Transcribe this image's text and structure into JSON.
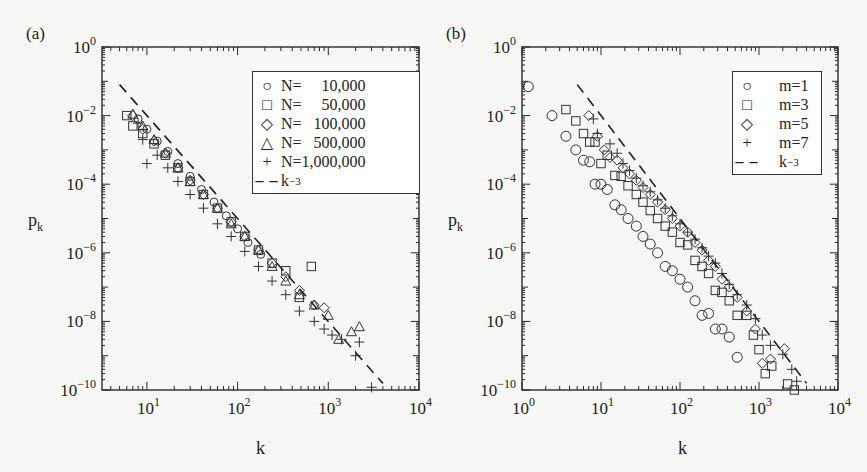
{
  "panels": [
    {
      "id": "a",
      "label": "(a)",
      "xlabel": "k",
      "ylabel": "p",
      "ylabel_sub": "k",
      "x_ticks": [
        {
          "exp": "1",
          "value": 10
        },
        {
          "exp": "2",
          "value": 100
        },
        {
          "exp": "3",
          "value": 1000
        },
        {
          "exp": "4",
          "value": 10000
        }
      ],
      "y_ticks": [
        {
          "exp": "0"
        },
        {
          "exp": "−2"
        },
        {
          "exp": "−4"
        },
        {
          "exp": "−6"
        },
        {
          "exp": "−8"
        },
        {
          "exp": "−10"
        }
      ],
      "legend": [
        {
          "symbol": "○",
          "text": "N=     10,000"
        },
        {
          "symbol": "□",
          "text": "N=     50,000"
        },
        {
          "symbol": "◇",
          "text": "N=   100,000"
        },
        {
          "symbol": "△",
          "text": "N=   500,000"
        },
        {
          "symbol": "+",
          "text": "N=1,000,000"
        },
        {
          "symbol": "– –",
          "text": "k",
          "sup": "−3"
        }
      ]
    },
    {
      "id": "b",
      "label": "(b)",
      "xlabel": "k",
      "ylabel": "p",
      "ylabel_sub": "k",
      "x_ticks": [
        {
          "exp": "0"
        },
        {
          "exp": "1"
        },
        {
          "exp": "2"
        },
        {
          "exp": "3"
        },
        {
          "exp": "4"
        }
      ],
      "y_ticks": [
        {
          "exp": "0"
        },
        {
          "exp": "−2"
        },
        {
          "exp": "−4"
        },
        {
          "exp": "−6"
        },
        {
          "exp": "−8"
        },
        {
          "exp": "−10"
        }
      ],
      "legend": [
        {
          "symbol": "○",
          "text": "m=1"
        },
        {
          "symbol": "□",
          "text": "m=3"
        },
        {
          "symbol": "◇",
          "text": "m=5"
        },
        {
          "symbol": "+",
          "text": "m=7"
        },
        {
          "symbol": "– –",
          "text": "k",
          "sup": "−3"
        }
      ]
    }
  ],
  "chart_data": [
    {
      "type": "scatter",
      "title": "(a)",
      "xlabel": "k",
      "ylabel": "p_k",
      "xscale": "log",
      "yscale": "log",
      "xlim": [
        3,
        10000
      ],
      "ylim": [
        1e-10,
        1
      ],
      "grid": false,
      "legend_position": "upper right",
      "series": [
        {
          "name": "N=10,000",
          "marker": "circle",
          "x": [
            8,
            10,
            13,
            17,
            22,
            30,
            40,
            55,
            75,
            100,
            130,
            180
          ],
          "y": [
            0.008,
            0.004,
            0.0018,
            0.0009,
            0.0004,
            0.00017,
            7e-05,
            3e-05,
            1.2e-05,
            5e-06,
            2e-06,
            9e-07
          ]
        },
        {
          "name": "N=50,000",
          "marker": "square",
          "x": [
            6,
            7,
            9,
            12,
            16,
            22,
            30,
            42,
            60,
            85,
            120,
            170,
            240,
            340,
            480,
            650
          ],
          "y": [
            0.01,
            0.005,
            0.003,
            0.0015,
            0.0007,
            0.0003,
            0.00012,
            5e-05,
            2e-05,
            8e-06,
            3e-06,
            1.2e-06,
            5e-07,
            3e-07,
            5e-08,
            4e-07
          ]
        },
        {
          "name": "N=100,000",
          "marker": "diamond",
          "x": [
            7,
            9,
            12,
            16,
            22,
            30,
            42,
            60,
            85,
            120,
            170,
            240,
            340,
            480,
            700,
            900
          ],
          "y": [
            0.01,
            0.004,
            0.0018,
            0.0008,
            0.0003,
            0.00013,
            5e-05,
            2e-05,
            8e-06,
            3e-06,
            1.2e-06,
            5e-07,
            2e-07,
            8e-08,
            3e-08,
            2.5e-08
          ]
        },
        {
          "name": "N=500,000",
          "marker": "triangle",
          "x": [
            7,
            9,
            12,
            16,
            22,
            30,
            42,
            60,
            85,
            120,
            170,
            240,
            340,
            480,
            700,
            1000,
            1300,
            1800,
            2200
          ],
          "y": [
            0.011,
            0.005,
            0.002,
            0.0008,
            0.0003,
            0.00012,
            5e-05,
            2e-05,
            7e-06,
            3e-06,
            1.2e-06,
            4e-07,
            1.5e-07,
            6e-08,
            3e-08,
            1.5e-08,
            3e-09,
            5e-09,
            7e-09
          ]
        },
        {
          "name": "N=1,000,000",
          "marker": "plus",
          "x": [
            8,
            9,
            10,
            13,
            17,
            22,
            30,
            42,
            60,
            85,
            120,
            170,
            240,
            340,
            480,
            700,
            900,
            1100,
            1400,
            2000,
            2200,
            3000
          ],
          "y": [
            0.006,
            0.002,
            0.0004,
            0.0007,
            0.0003,
            0.00012,
            5e-05,
            2e-05,
            7e-06,
            3e-06,
            1.1e-06,
            4e-07,
            1.5e-07,
            6e-08,
            2e-08,
            1e-08,
            6e-09,
            4e-09,
            3e-09,
            1e-09,
            2.5e-09,
            1.2e-10
          ]
        },
        {
          "name": "k^-3",
          "type": "line",
          "style": "dashed",
          "x": [
            5,
            4000
          ],
          "y": [
            0.08,
            1.56e-10
          ]
        }
      ]
    },
    {
      "type": "scatter",
      "title": "(b)",
      "xlabel": "k",
      "ylabel": "p_k",
      "xscale": "log",
      "yscale": "log",
      "xlim": [
        1,
        10000
      ],
      "ylim": [
        1e-10,
        1
      ],
      "grid": false,
      "legend_position": "upper right",
      "series": [
        {
          "name": "m=1",
          "marker": "circle",
          "x": [
            1.2,
            2.4,
            3.6,
            4.8,
            6,
            7.2,
            8.4,
            10,
            12,
            15,
            18,
            22,
            28,
            34,
            42,
            52,
            65,
            80,
            100,
            125,
            155,
            190,
            230,
            280,
            340,
            420,
            530
          ],
          "y": [
            0.07,
            0.01,
            0.0025,
            0.001,
            0.0005,
            0.00045,
            0.0001,
            0.0001,
            7e-05,
            2.5e-05,
            1.8e-05,
            1e-05,
            6e-06,
            3e-06,
            1.8e-06,
            1e-06,
            4e-07,
            3e-07,
            1.7e-07,
            1e-07,
            4e-08,
            1.5e-08,
            1.7e-08,
            6e-09,
            6e-09,
            3.5e-09,
            9e-10
          ]
        },
        {
          "name": "m=3",
          "marker": "square",
          "x": [
            3.6,
            4.8,
            6,
            7.2,
            8.4,
            10,
            12,
            15,
            18,
            22,
            28,
            34,
            42,
            52,
            65,
            80,
            100,
            125,
            155,
            190,
            230,
            280,
            340,
            420,
            530,
            700,
            850,
            1000,
            1200,
            1450,
            2300,
            2800
          ],
          "y": [
            0.015,
            0.007,
            0.003,
            0.0017,
            0.0017,
            0.0004,
            0.0007,
            0.00018,
            0.00017,
            9e-05,
            5e-05,
            3e-05,
            1.7e-05,
            1e-05,
            6e-06,
            4e-06,
            2e-06,
            1.7e-06,
            6e-07,
            4e-07,
            2.5e-07,
            8e-08,
            7e-08,
            4e-08,
            1.5e-08,
            1.5e-08,
            4e-09,
            1.5e-09,
            3e-10,
            5e-10,
            1.5e-10,
            1e-10
          ]
        },
        {
          "name": "m=5",
          "marker": "diamond",
          "x": [
            7,
            9,
            11,
            13,
            16,
            19,
            23,
            28,
            34,
            42,
            52,
            65,
            80,
            100,
            125,
            155,
            190,
            230,
            280,
            340,
            420,
            530,
            700,
            900,
            1100,
            1400,
            2100
          ],
          "y": [
            0.01,
            0.0025,
            0.001,
            0.0006,
            0.0005,
            0.0003,
            0.0002,
            0.00013,
            8e-05,
            5e-05,
            3e-05,
            1.8e-05,
            1e-05,
            6e-06,
            4e-06,
            2e-06,
            1.2e-06,
            6e-07,
            4e-07,
            1.7e-07,
            1e-07,
            5e-08,
            2e-08,
            6e-09,
            6e-10,
            8e-10,
            1.6e-09
          ]
        },
        {
          "name": "m=7",
          "marker": "plus",
          "x": [
            8,
            9,
            13,
            16,
            19,
            23,
            28,
            34,
            42,
            52,
            65,
            80,
            100,
            125,
            155,
            190,
            230,
            280,
            340,
            420,
            530,
            700,
            900,
            1100,
            1400,
            2000,
            2600,
            3000
          ],
          "y": [
            0.008,
            0.003,
            0.0015,
            0.0008,
            0.0004,
            0.00025,
            0.00015,
            9e-05,
            6e-05,
            3.5e-05,
            2e-05,
            1.2e-05,
            7e-06,
            4e-06,
            2.5e-06,
            1.4e-06,
            8e-07,
            5e-07,
            2.5e-07,
            1.2e-07,
            6e-08,
            3e-08,
            1.2e-08,
            4e-09,
            2e-09,
            1.1e-09,
            4e-10,
            1.8e-10
          ]
        },
        {
          "name": "k^-3",
          "type": "line",
          "style": "dashed",
          "x": [
            5,
            4000
          ],
          "y": [
            0.08,
            1.56e-10
          ]
        }
      ]
    }
  ]
}
